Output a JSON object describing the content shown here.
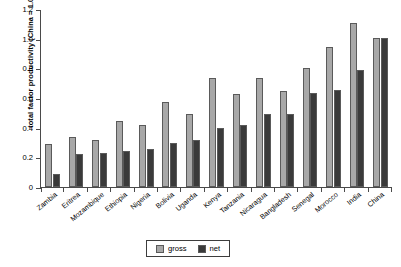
{
  "chart_data": {
    "type": "bar",
    "title": "",
    "xlabel": "",
    "ylabel": "total factor productivity (China = 1.0)",
    "ylim": [
      0,
      1.2
    ],
    "yticks": [
      "0",
      "0.2",
      "0.4",
      "0.6",
      "0.8",
      "1.0",
      "1.2"
    ],
    "ytick_values": [
      0,
      0.2,
      0.4,
      0.6,
      0.8,
      1.0,
      1.2
    ],
    "grid": false,
    "legend_position": "bottom-center",
    "categories": [
      "Zambia",
      "Eritrea",
      "Mozambique",
      "Ethiopia",
      "Nigeria",
      "Bolivia",
      "Uganda",
      "Kenya",
      "Tanzania",
      "Nicaragua",
      "Bangladesh",
      "Senegal",
      "Morocco",
      "India",
      "China"
    ],
    "series": [
      {
        "name": "gross",
        "color": "#a8a8a8",
        "values": [
          0.29,
          0.335,
          0.315,
          0.445,
          0.42,
          0.575,
          0.49,
          0.735,
          0.63,
          0.735,
          0.65,
          0.8,
          0.945,
          1.105,
          1.005
        ]
      },
      {
        "name": "net",
        "color": "#3a3a3a",
        "values": [
          0.09,
          0.225,
          0.23,
          0.245,
          0.255,
          0.3,
          0.315,
          0.395,
          0.415,
          0.495,
          0.49,
          0.635,
          0.655,
          0.79,
          1.005
        ]
      }
    ]
  },
  "legend": {
    "items": [
      {
        "label": "gross",
        "key": "gross"
      },
      {
        "label": "net",
        "key": "net"
      }
    ]
  }
}
